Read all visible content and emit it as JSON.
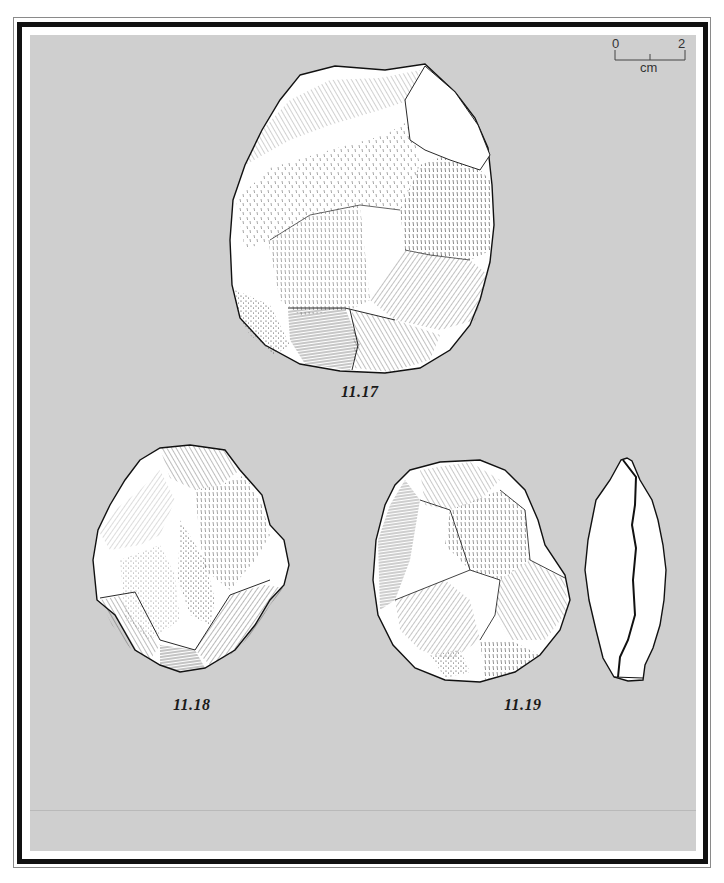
{
  "plate": {
    "background_color": "#cfcfcf",
    "border_color": "#111111",
    "scale_bar": {
      "start_label": "0",
      "end_label": "2",
      "unit_label": "cm"
    },
    "figures": [
      {
        "id": "fig-11-17",
        "caption": "11.17",
        "view": "face"
      },
      {
        "id": "fig-11-18",
        "caption": "11.18",
        "view": "face"
      },
      {
        "id": "fig-11-19",
        "caption": "11.19",
        "view": "face and profile"
      }
    ]
  }
}
